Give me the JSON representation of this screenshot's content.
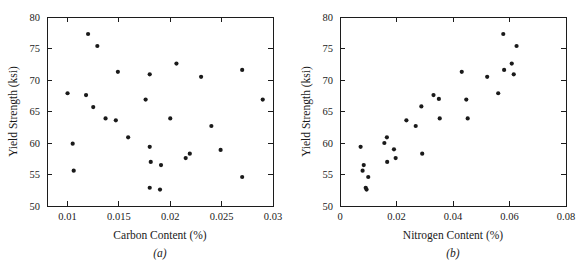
{
  "figure": {
    "background": "#ffffff",
    "ink_color": "#1a1a1a",
    "marker_color": "#1a1a1a",
    "panel_count": 2
  },
  "panel_a": {
    "label": "(a)",
    "xlabel": "Carbon Content (%)",
    "ylabel": "Yield Strength (ksi)",
    "xticklabels": [
      "0.01",
      "0.015",
      "0.02",
      "0.025",
      "0.03"
    ],
    "yticklabels": [
      "50",
      "55",
      "60",
      "65",
      "70",
      "75",
      "80"
    ]
  },
  "panel_b": {
    "label": "(b)",
    "xlabel": "Nitrogen Content (%)",
    "ylabel": "Yield Strength (ksi)",
    "xticklabels": [
      "0",
      "0.02",
      "0.04",
      "0.06",
      "0.08"
    ],
    "yticklabels": [
      "50",
      "55",
      "60",
      "65",
      "70",
      "75",
      "80"
    ]
  },
  "chart_data": [
    {
      "type": "scatter",
      "panel": "(a)",
      "title": "",
      "xlabel": "Carbon Content (%)",
      "ylabel": "Yield Strength (ksi)",
      "xlim": [
        0.008,
        0.03
      ],
      "ylim": [
        50,
        80
      ],
      "xticks": [
        0.01,
        0.015,
        0.02,
        0.025,
        0.03
      ],
      "yticks": [
        50,
        55,
        60,
        65,
        70,
        75,
        80
      ],
      "grid": false,
      "legend": null,
      "x": [
        0.01,
        0.0105,
        0.0106,
        0.0118,
        0.012,
        0.0125,
        0.0128,
        0.0136,
        0.0147,
        0.0149,
        0.0159,
        0.0176,
        0.018,
        0.018,
        0.018,
        0.0181,
        0.0189,
        0.019,
        0.02,
        0.02,
        0.0207,
        0.0215,
        0.0219,
        0.0229,
        0.0239,
        0.0249,
        0.025,
        0.0269,
        0.027,
        0.0289
      ],
      "y": [
        67.9,
        59.9,
        55.6,
        67.6,
        77.3,
        65.7,
        75.4,
        63.9,
        63.6,
        71.3,
        60.9,
        66.9,
        70.9,
        59.4,
        57.0,
        52.9,
        52.6,
        56.5,
        72.6,
        63.9,
        57.6,
        58.3,
        70.5,
        62.7,
        58.9,
        71.6,
        54.6,
        66.9
      ],
      "values": [
        {
          "x": 0.01,
          "y": 67.9
        },
        {
          "x": 0.0105,
          "y": 59.9
        },
        {
          "x": 0.0106,
          "y": 55.6
        },
        {
          "x": 0.0118,
          "y": 67.6
        },
        {
          "x": 0.012,
          "y": 77.3
        },
        {
          "x": 0.0125,
          "y": 65.7
        },
        {
          "x": 0.0129,
          "y": 75.4
        },
        {
          "x": 0.0137,
          "y": 63.9
        },
        {
          "x": 0.0147,
          "y": 63.6
        },
        {
          "x": 0.0149,
          "y": 71.3
        },
        {
          "x": 0.0159,
          "y": 60.9
        },
        {
          "x": 0.0176,
          "y": 66.9
        },
        {
          "x": 0.018,
          "y": 70.9
        },
        {
          "x": 0.018,
          "y": 59.4
        },
        {
          "x": 0.0181,
          "y": 57.0
        },
        {
          "x": 0.018,
          "y": 52.9
        },
        {
          "x": 0.019,
          "y": 52.6
        },
        {
          "x": 0.0191,
          "y": 56.5
        },
        {
          "x": 0.0206,
          "y": 72.6
        },
        {
          "x": 0.02,
          "y": 63.9
        },
        {
          "x": 0.0215,
          "y": 57.6
        },
        {
          "x": 0.0219,
          "y": 58.3
        },
        {
          "x": 0.023,
          "y": 70.5
        },
        {
          "x": 0.024,
          "y": 62.7
        },
        {
          "x": 0.0249,
          "y": 58.9
        },
        {
          "x": 0.027,
          "y": 71.6
        },
        {
          "x": 0.027,
          "y": 54.6
        },
        {
          "x": 0.029,
          "y": 66.9
        }
      ]
    },
    {
      "type": "scatter",
      "panel": "(b)",
      "title": "",
      "xlabel": "Nitrogen Content (%)",
      "ylabel": "Yield Strength (ksi)",
      "xlim": [
        0,
        0.08
      ],
      "ylim": [
        50,
        80
      ],
      "xticks": [
        0,
        0.02,
        0.04,
        0.06,
        0.08
      ],
      "yticks": [
        50,
        55,
        60,
        65,
        70,
        75,
        80
      ],
      "grid": false,
      "legend": null,
      "x": [
        0.0073,
        0.008,
        0.0084,
        0.0091,
        0.0093,
        0.0099,
        0.0156,
        0.0165,
        0.0167,
        0.0191,
        0.0196,
        0.0235,
        0.0268,
        0.0288,
        0.029,
        0.033,
        0.0349,
        0.0352,
        0.043,
        0.0447,
        0.0452,
        0.0521,
        0.0559,
        0.0577,
        0.058,
        0.0607,
        0.0615,
        0.062,
        0.0624,
        0.063
      ],
      "y": [
        59.4,
        55.6,
        56.5,
        52.9,
        52.6,
        54.6,
        60.0,
        60.9,
        57.0,
        59.0,
        57.6,
        63.6,
        62.7,
        65.8,
        58.3,
        67.6,
        67.0,
        63.9,
        71.3,
        66.9,
        63.9,
        70.5,
        67.9,
        77.3,
        71.6,
        72.6,
        70.9,
        75.4
      ],
      "values": [
        {
          "x": 0.0073,
          "y": 59.4
        },
        {
          "x": 0.008,
          "y": 55.6
        },
        {
          "x": 0.0084,
          "y": 56.5
        },
        {
          "x": 0.0091,
          "y": 52.9
        },
        {
          "x": 0.0094,
          "y": 52.6
        },
        {
          "x": 0.01,
          "y": 54.6
        },
        {
          "x": 0.0157,
          "y": 60.0
        },
        {
          "x": 0.0166,
          "y": 60.9
        },
        {
          "x": 0.0167,
          "y": 57.0
        },
        {
          "x": 0.0191,
          "y": 59.0
        },
        {
          "x": 0.0197,
          "y": 57.6
        },
        {
          "x": 0.0235,
          "y": 63.6
        },
        {
          "x": 0.0268,
          "y": 62.7
        },
        {
          "x": 0.0288,
          "y": 65.8
        },
        {
          "x": 0.0291,
          "y": 58.3
        },
        {
          "x": 0.0331,
          "y": 67.6
        },
        {
          "x": 0.035,
          "y": 67.0
        },
        {
          "x": 0.0353,
          "y": 63.9
        },
        {
          "x": 0.0431,
          "y": 71.3
        },
        {
          "x": 0.0447,
          "y": 66.9
        },
        {
          "x": 0.0452,
          "y": 63.9
        },
        {
          "x": 0.0521,
          "y": 70.5
        },
        {
          "x": 0.056,
          "y": 67.9
        },
        {
          "x": 0.0578,
          "y": 77.3
        },
        {
          "x": 0.0581,
          "y": 71.6
        },
        {
          "x": 0.0608,
          "y": 72.6
        },
        {
          "x": 0.0615,
          "y": 70.9
        },
        {
          "x": 0.0625,
          "y": 75.4
        }
      ]
    }
  ]
}
